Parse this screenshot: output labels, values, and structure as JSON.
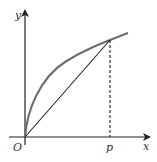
{
  "diagram": {
    "type": "function-graph",
    "axes": {
      "x_label": "x",
      "y_label": "y",
      "origin_label": "O"
    },
    "point_label": "p",
    "elements": [
      "concave increasing curve from origin",
      "chord from origin to point on curve above p",
      "dashed vertical line from curve down to p on x-axis"
    ],
    "colors": {
      "curve": "#6e6e6e",
      "axes": "#222222",
      "chord": "#222222"
    }
  }
}
